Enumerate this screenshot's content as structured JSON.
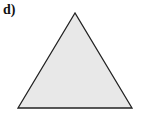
{
  "figure": {
    "label": "d)",
    "shape": "equilateral-triangle",
    "fill": "#e8e8e8",
    "stroke": "#222222",
    "points": [
      [
        75,
        13
      ],
      [
        18,
        108
      ],
      [
        132,
        108
      ]
    ]
  }
}
